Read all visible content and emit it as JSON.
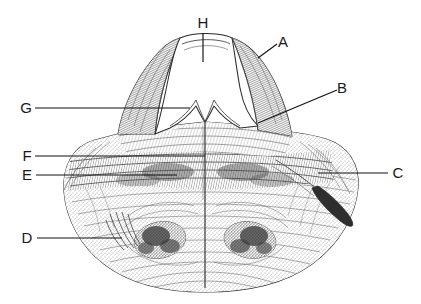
{
  "figure": {
    "kind": "anatomical-line-drawing",
    "background_color": "#ffffff",
    "ink_color": "#1a1a1a",
    "width": 421,
    "height": 304
  },
  "labels": [
    {
      "id": "A",
      "text": "A",
      "x": 283,
      "y": 47,
      "leader": {
        "type": "diagonal",
        "x1": 277,
        "y1": 44,
        "x2": 258,
        "y2": 58
      }
    },
    {
      "id": "B",
      "text": "B",
      "x": 342,
      "y": 93,
      "leader": {
        "type": "diagonal",
        "x1": 337,
        "y1": 90,
        "x2": 258,
        "y2": 123
      }
    },
    {
      "id": "C",
      "text": "C",
      "x": 394,
      "y": 178,
      "leader": {
        "type": "horizontal",
        "x1": 388,
        "y1": 173,
        "x2": 318,
        "y2": 173
      }
    },
    {
      "id": "D",
      "text": "D",
      "x": 22,
      "y": 243,
      "leader": {
        "type": "horizontal",
        "x1": 37,
        "y1": 238,
        "x2": 122,
        "y2": 238
      }
    },
    {
      "id": "E",
      "text": "E",
      "x": 22,
      "y": 180,
      "leader": {
        "type": "horizontal",
        "x1": 36,
        "y1": 175,
        "x2": 177,
        "y2": 175
      }
    },
    {
      "id": "F",
      "text": "F",
      "x": 22,
      "y": 161,
      "leader": {
        "type": "horizontal",
        "x1": 35,
        "y1": 156,
        "x2": 205,
        "y2": 156
      }
    },
    {
      "id": "G",
      "text": "G",
      "x": 19,
      "y": 113,
      "leader": {
        "type": "horizontal",
        "x1": 35,
        "y1": 108,
        "x2": 190,
        "y2": 108
      }
    },
    {
      "id": "H",
      "text": "H",
      "x": 198,
      "y": 28,
      "leader": {
        "type": "vertical",
        "x1": 203,
        "y1": 33,
        "x2": 203,
        "y2": 62
      }
    }
  ],
  "label_sequence": "A B C D E F G H",
  "label_count": 8,
  "structures": [
    {
      "name": "left-superior-peak",
      "region": "upper-left"
    },
    {
      "name": "right-superior-peak",
      "region": "upper-right"
    },
    {
      "name": "central-notch-cavity",
      "region": "upper-center"
    },
    {
      "name": "left-lateral-lobe",
      "region": "mid-left"
    },
    {
      "name": "right-lateral-lobe",
      "region": "mid-right"
    },
    {
      "name": "midline-raphe",
      "region": "center-vertical"
    },
    {
      "name": "left-inferior-nucleus",
      "region": "lower-left"
    },
    {
      "name": "right-inferior-nucleus",
      "region": "lower-right"
    },
    {
      "name": "right-nerve-root",
      "region": "lower-right-edge"
    }
  ]
}
